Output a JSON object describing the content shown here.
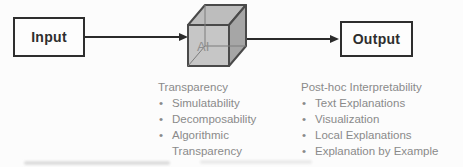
{
  "flow": {
    "input_label": "Input",
    "core_label": "AI",
    "output_label": "Output"
  },
  "annotations": {
    "left": {
      "heading": "Transparency",
      "items": [
        "Simulatability",
        "Decomposability",
        "Algorithmic Transparency"
      ],
      "bullet": "•"
    },
    "right": {
      "heading": "Post-hoc Interpretability",
      "items": [
        "Text Explanations",
        "Visualization",
        "Local Explanations",
        "Explanation by Example"
      ],
      "bullet": "•"
    }
  },
  "colors": {
    "box_border": "#2e2e2e",
    "box_text": "#2e2e2e",
    "arrow": "#2b2b2b",
    "annotation_text": "#8a8a8a",
    "cube_front": "#c6c6c6",
    "cube_top": "#bdbdbd",
    "cube_right": "#a6a6a6",
    "cube_edge": "#4a4a4a",
    "cube_label_text": "#8f8f8f"
  }
}
